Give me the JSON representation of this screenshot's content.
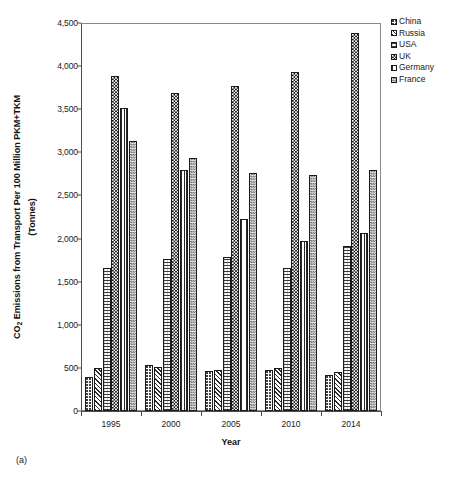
{
  "caption": "(a)",
  "axes": {
    "ylabel_line1": "CO",
    "ylabel_sub": "2",
    "ylabel_line1b": " Emissions from Transport Per 100 Million PKM+TKM",
    "ylabel_line2": "(Tonnes)",
    "xlabel": "Year",
    "yticks": [
      "0",
      "500",
      "1,000",
      "1,500",
      "2,000",
      "2,500",
      "3,000",
      "3,500",
      "4,000",
      "4,500"
    ],
    "xticks": [
      "1995",
      "2000",
      "2005",
      "2010",
      "2014"
    ]
  },
  "legend": {
    "position": "right",
    "entries": [
      {
        "label": "China",
        "pattern": "fine-dotted",
        "key": "china"
      },
      {
        "label": "Russia",
        "pattern": "diagonal-hatch",
        "key": "russia"
      },
      {
        "label": "USA",
        "pattern": "horizontal-grid",
        "key": "usa"
      },
      {
        "label": "UK",
        "pattern": "checkerboard-black",
        "key": "uk"
      },
      {
        "label": "Germany",
        "pattern": "vertical-lines",
        "key": "germany"
      },
      {
        "label": "France",
        "pattern": "checkerboard-gray",
        "key": "france"
      }
    ]
  },
  "chart_data": {
    "type": "bar",
    "title": "",
    "xlabel": "Year",
    "ylabel": "CO2 Emissions from Transport Per 100 Million PKM+TKM (Tonnes)",
    "categories": [
      "1995",
      "2000",
      "2005",
      "2010",
      "2014"
    ],
    "ylim": [
      0,
      4500
    ],
    "ytick_step": 500,
    "grid": false,
    "legend_position": "right",
    "series": [
      {
        "name": "China",
        "values": [
          400,
          535,
          465,
          480,
          415
        ]
      },
      {
        "name": "Russia",
        "values": [
          500,
          510,
          470,
          495,
          450
        ]
      },
      {
        "name": "USA",
        "values": [
          1660,
          1760,
          1790,
          1660,
          1910
        ]
      },
      {
        "name": "UK",
        "values": [
          3890,
          3690,
          3770,
          3935,
          4390
        ]
      },
      {
        "name": "Germany",
        "values": [
          3510,
          2790,
          2230,
          1975,
          2060
        ]
      },
      {
        "name": "France",
        "values": [
          3130,
          2930,
          2765,
          2735,
          2800
        ]
      }
    ]
  }
}
